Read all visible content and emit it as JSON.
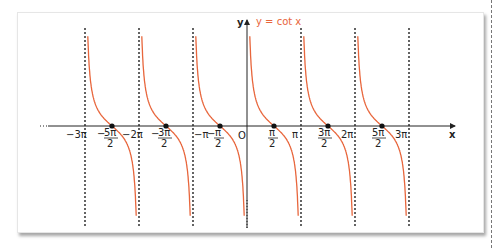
{
  "chart_data": {
    "type": "line",
    "title": "y = cot x",
    "function": "cot x",
    "xlabel": "x",
    "ylabel": "y",
    "origin_label": "O",
    "asymptotes": [
      "-3π",
      "-2π",
      "-π",
      "0",
      "π",
      "2π",
      "3π"
    ],
    "zeros": [
      "-5π/2",
      "-3π/2",
      "-π/2",
      "π/2",
      "3π/2",
      "5π/2"
    ],
    "x_tick_labels": [
      {
        "label": "−3π",
        "value": "-3π"
      },
      {
        "label": "−5π/2",
        "num": "5π",
        "den": "2",
        "sign": "−",
        "value": "-5π/2"
      },
      {
        "label": "−2π",
        "value": "-2π"
      },
      {
        "label": "−3π/2",
        "num": "3π",
        "den": "2",
        "sign": "−",
        "value": "-3π/2"
      },
      {
        "label": "−π",
        "value": "-π"
      },
      {
        "label": "−π/2",
        "num": "π",
        "den": "2",
        "sign": "−",
        "value": "-π/2"
      },
      {
        "label": "π/2",
        "num": "π",
        "den": "2",
        "sign": "",
        "value": "π/2"
      },
      {
        "label": "π",
        "value": "π"
      },
      {
        "label": "3π/2",
        "num": "3π",
        "den": "2",
        "sign": "",
        "value": "3π/2"
      },
      {
        "label": "2π",
        "value": "2π"
      },
      {
        "label": "5π/2",
        "num": "5π",
        "den": "2",
        "sign": "",
        "value": "5π/2"
      },
      {
        "label": "3π",
        "value": "3π"
      }
    ],
    "xlim": [
      "-3.3π",
      "3.6π"
    ],
    "grid": false,
    "series": [
      {
        "name": "y = cot x",
        "color": "#e8663c",
        "branches": 6
      }
    ],
    "asymptote_style": "dotted black",
    "zero_markers": "black dots"
  },
  "labels": {
    "title": "y = cot x",
    "x_axis": "x",
    "y_axis": "y",
    "origin": "O",
    "neg3pi": "−3π",
    "neg2pi": "−2π",
    "negpi": "−π",
    "pi": "π",
    "twopi": "2π",
    "threepi": "3π",
    "neg5pi2_num": "5π",
    "neg3pi2_num": "3π",
    "negpi2_num": "π",
    "pi2_num": "π",
    "threepi2_num": "3π",
    "fivepi2_num": "5π",
    "den": "2",
    "minus": "−"
  },
  "colors": {
    "curve": "#e8663c",
    "axis": "#222222",
    "asymptote": "#111111"
  }
}
